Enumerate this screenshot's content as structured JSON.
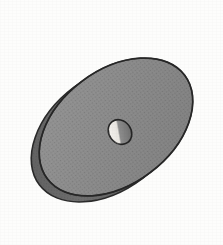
{
  "scene": {
    "title": "Shaded 3D disc with central bore",
    "subject": "disc-washer",
    "view": "oblique perspective, tilted",
    "caption": "",
    "width_px": 223,
    "height_px": 245
  },
  "colors": {
    "background": "#fdfdfc",
    "face_fill": "#8a8a8a",
    "face_fill_light": "#949494",
    "face_fill_dark": "#7f7f7f",
    "rim_fill": "#6e6e6e",
    "rim_fill_dark": "#5d5d5d",
    "outline": "#2a2a2a",
    "hole_shadow": "#6b6b6b",
    "hole_highlight": "#f4f2ee",
    "hole_outline": "#242424"
  },
  "geometry": {
    "face": {
      "label": "disc-front-face",
      "center_x": 116,
      "center_y": 127,
      "radius_x": 86,
      "radius_y": 57,
      "rotation_deg": -37
    },
    "back_face": {
      "label": "disc-back-face",
      "center_x": 108,
      "center_y": 133,
      "radius_x": 86,
      "radius_y": 57,
      "rotation_deg": -37
    },
    "hole": {
      "label": "center-bore",
      "center_x": 120,
      "center_y": 132,
      "radius_x": 11,
      "radius_y": 13,
      "rotation_deg": -37
    },
    "extents": {
      "top_y": 25,
      "bottom_y": 232,
      "left_x": 27,
      "right_x": 202
    },
    "thickness_px": 9
  },
  "parts": [
    {
      "id": "front-face",
      "name": "Front face",
      "shading": "flat mid gray"
    },
    {
      "id": "edge-band",
      "name": "Outer edge band",
      "shading": "darker gray, left and lower-left"
    },
    {
      "id": "bore-wall",
      "name": "Bore inner wall",
      "shading": "light highlight on left crescent"
    },
    {
      "id": "silhouette",
      "name": "Silhouette outline",
      "shading": "thin dark stroke"
    }
  ]
}
